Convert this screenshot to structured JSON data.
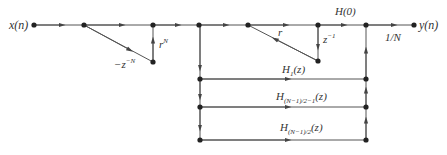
{
  "diagram": {
    "type": "signal-flow-graph",
    "colors": {
      "line": "#444444",
      "node": "#222222",
      "background": "#ffffff"
    },
    "labels": {
      "input": "x(n)",
      "output": "y(n)",
      "comb_gain_main": "−z",
      "comb_gain_exp": "−N",
      "r_pow_main": "r",
      "r_pow_exp": "N",
      "feedback_r": "r",
      "delay_main": "z",
      "delay_exp": "−1",
      "h0": "H(0)",
      "h1_main": "H",
      "h1_sub": "1",
      "h1_arg": "(z)",
      "hmid_main": "H",
      "hmid_sub": "(N−1)/2−1",
      "hmid_arg": "(z)",
      "hlast_main": "H",
      "hlast_sub": "(N−1)/2",
      "hlast_arg": "(z)",
      "scale": "1/N"
    },
    "nodes": [
      {
        "id": "x",
        "x": 34,
        "y": 25
      },
      {
        "id": "n1",
        "x": 84,
        "y": 25
      },
      {
        "id": "n2",
        "x": 153,
        "y": 25
      },
      {
        "id": "n2b",
        "x": 153,
        "y": 62
      },
      {
        "id": "n3",
        "x": 199,
        "y": 25
      },
      {
        "id": "n4",
        "x": 248,
        "y": 25
      },
      {
        "id": "n5",
        "x": 318,
        "y": 25
      },
      {
        "id": "n5b",
        "x": 318,
        "y": 61
      },
      {
        "id": "n6",
        "x": 366,
        "y": 25
      },
      {
        "id": "y",
        "x": 414,
        "y": 25
      },
      {
        "id": "l1",
        "x": 200,
        "y": 79
      },
      {
        "id": "l2",
        "x": 200,
        "y": 107
      },
      {
        "id": "l3",
        "x": 200,
        "y": 140
      },
      {
        "id": "r1",
        "x": 366,
        "y": 79
      },
      {
        "id": "r2",
        "x": 366,
        "y": 107
      },
      {
        "id": "r3",
        "x": 366,
        "y": 140
      }
    ],
    "caption": ""
  }
}
